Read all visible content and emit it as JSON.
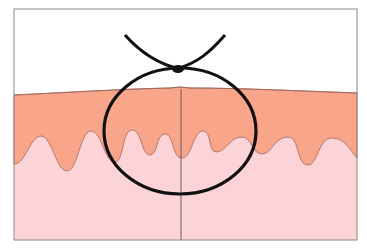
{
  "diagram": {
    "colors": {
      "background": "#ffffff",
      "frame": "#8a8a8a",
      "epidermis": "#f8a589",
      "dermis": "#fcd3d6",
      "boundary": "#a0685a",
      "ligature": "#111111",
      "midline": "#555555"
    },
    "layers": [
      {
        "name": "air",
        "color": "#ffffff"
      },
      {
        "name": "epidermis",
        "color": "#f8a589"
      },
      {
        "name": "dermis",
        "color": "#fcd3d6"
      }
    ],
    "elements": [
      {
        "name": "ligature-loop",
        "shape": "ellipse"
      },
      {
        "name": "knot",
        "shape": "dot"
      },
      {
        "name": "suture-ends",
        "count": 2
      },
      {
        "name": "incision-midline",
        "shape": "vertical-line"
      }
    ]
  }
}
